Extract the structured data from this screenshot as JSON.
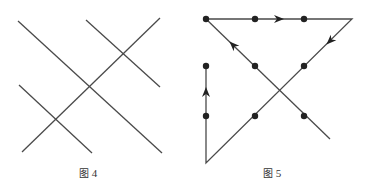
{
  "figures": [
    {
      "id": "fig4",
      "caption": {
        "prefix": "图",
        "number": "4"
      },
      "lines": [
        {
          "x1": 18,
          "y1": 21,
          "x2": 162,
          "y2": 153
        },
        {
          "x1": 86,
          "y1": 20,
          "x2": 160,
          "y2": 87
        },
        {
          "x1": 19,
          "y1": 85,
          "x2": 92,
          "y2": 153
        },
        {
          "x1": 22,
          "y1": 152,
          "x2": 160,
          "y2": 18
        }
      ]
    },
    {
      "id": "fig5",
      "caption": {
        "prefix": "图",
        "number": "5"
      },
      "path": [
        [
          206,
          19
        ],
        [
          352,
          19
        ],
        [
          206,
          163
        ],
        [
          206,
          66
        ]
      ],
      "extra_lines": [
        {
          "x1": 206,
          "y1": 19,
          "x2": 330,
          "y2": 139
        }
      ],
      "dots": [
        [
          206,
          19
        ],
        [
          255,
          19
        ],
        [
          304,
          19
        ],
        [
          206,
          66
        ],
        [
          255,
          66
        ],
        [
          304,
          66
        ],
        [
          206,
          116
        ],
        [
          255,
          116
        ],
        [
          304,
          116
        ]
      ],
      "arrows": [
        {
          "x": 279,
          "y": 19,
          "direction": "right"
        },
        {
          "x": 330,
          "y": 41,
          "direction": "down-left"
        },
        {
          "x": 206,
          "y": 92,
          "direction": "up"
        },
        {
          "x": 233,
          "y": 45,
          "direction": "up-left"
        }
      ]
    }
  ],
  "style": {
    "line_color": "#4a4a4a",
    "dot_color": "#222222"
  }
}
